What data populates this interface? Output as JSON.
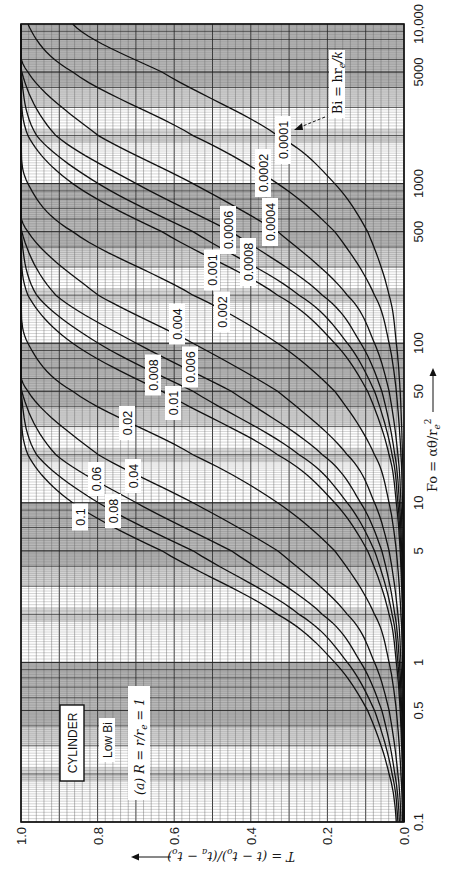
{
  "chart_data": {
    "type": "line",
    "orientation": "rotated 90° clockwise (Fo axis vertical on right, T axis horizontal on bottom)",
    "xlabel": "Fo = αθ/r_e²",
    "ylabel": "T = (t − t_o)/(t_a − t_o)",
    "xscale": "log",
    "xlim": [
      0.1,
      10000
    ],
    "ylim": [
      0.0,
      1.0
    ],
    "x_ticks": [
      0.1,
      0.5,
      1,
      5,
      10,
      50,
      100,
      500,
      1000,
      5000,
      10000
    ],
    "x_tick_labels": [
      "0.1",
      "0.5",
      "1",
      "5",
      "10",
      "50",
      "100",
      "500",
      "1000",
      "5000",
      "10,000"
    ],
    "y_ticks": [
      0.0,
      0.2,
      0.4,
      0.6,
      0.8,
      1.0
    ],
    "y_tick_labels": [
      "0.0",
      "0.2",
      "0.4",
      "0.6",
      "0.8",
      "1.0"
    ],
    "grid": true,
    "legend_title": "Bi = hr_e/k",
    "x": [
      0.1,
      0.2,
      0.5,
      1,
      2,
      5,
      10,
      20,
      50,
      100,
      200,
      500,
      1000,
      2000,
      5000,
      10000
    ],
    "series": [
      {
        "name": "0.1",
        "values": [
          0.02,
          0.039,
          0.095,
          0.181,
          0.33,
          0.632,
          0.865,
          0.982,
          1.0,
          1.0,
          1.0,
          1.0,
          1.0,
          1.0,
          1.0,
          1.0
        ]
      },
      {
        "name": "0.08",
        "values": [
          0.016,
          0.031,
          0.077,
          0.148,
          0.274,
          0.551,
          0.798,
          0.959,
          1.0,
          1.0,
          1.0,
          1.0,
          1.0,
          1.0,
          1.0,
          1.0
        ]
      },
      {
        "name": "0.06",
        "values": [
          0.012,
          0.024,
          0.058,
          0.113,
          0.213,
          0.451,
          0.699,
          0.909,
          0.998,
          1.0,
          1.0,
          1.0,
          1.0,
          1.0,
          1.0,
          1.0
        ]
      },
      {
        "name": "0.04",
        "values": [
          0.008,
          0.016,
          0.039,
          0.077,
          0.148,
          0.33,
          0.551,
          0.798,
          0.982,
          1.0,
          1.0,
          1.0,
          1.0,
          1.0,
          1.0,
          1.0
        ]
      },
      {
        "name": "0.02",
        "values": [
          0.004,
          0.008,
          0.02,
          0.039,
          0.077,
          0.181,
          0.33,
          0.551,
          0.865,
          0.982,
          1.0,
          1.0,
          1.0,
          1.0,
          1.0,
          1.0
        ]
      },
      {
        "name": "0.01",
        "values": [
          0.002,
          0.004,
          0.01,
          0.02,
          0.039,
          0.095,
          0.181,
          0.33,
          0.632,
          0.865,
          0.982,
          1.0,
          1.0,
          1.0,
          1.0,
          1.0
        ]
      },
      {
        "name": "0.008",
        "values": [
          0.002,
          0.003,
          0.008,
          0.016,
          0.031,
          0.077,
          0.148,
          0.274,
          0.551,
          0.798,
          0.959,
          1.0,
          1.0,
          1.0,
          1.0,
          1.0
        ]
      },
      {
        "name": "0.006",
        "values": [
          0.001,
          0.002,
          0.006,
          0.012,
          0.024,
          0.058,
          0.113,
          0.213,
          0.451,
          0.699,
          0.909,
          0.998,
          1.0,
          1.0,
          1.0,
          1.0
        ]
      },
      {
        "name": "0.004",
        "values": [
          0.001,
          0.002,
          0.004,
          0.008,
          0.016,
          0.039,
          0.077,
          0.148,
          0.33,
          0.551,
          0.798,
          0.982,
          1.0,
          1.0,
          1.0,
          1.0
        ]
      },
      {
        "name": "0.002",
        "values": [
          0.0,
          0.001,
          0.002,
          0.004,
          0.008,
          0.02,
          0.039,
          0.077,
          0.181,
          0.33,
          0.551,
          0.865,
          0.982,
          1.0,
          1.0,
          1.0
        ]
      },
      {
        "name": "0.001",
        "values": [
          0.0,
          0.0,
          0.001,
          0.002,
          0.004,
          0.01,
          0.02,
          0.039,
          0.095,
          0.181,
          0.33,
          0.632,
          0.865,
          0.982,
          1.0,
          1.0
        ]
      },
      {
        "name": "0.0008",
        "values": [
          0.0,
          0.0,
          0.001,
          0.002,
          0.003,
          0.008,
          0.016,
          0.031,
          0.077,
          0.148,
          0.274,
          0.551,
          0.798,
          0.959,
          1.0,
          1.0
        ]
      },
      {
        "name": "0.0006",
        "values": [
          0.0,
          0.0,
          0.001,
          0.001,
          0.002,
          0.006,
          0.012,
          0.024,
          0.058,
          0.113,
          0.213,
          0.451,
          0.699,
          0.909,
          0.998,
          1.0
        ]
      },
      {
        "name": "0.0004",
        "values": [
          0.0,
          0.0,
          0.0,
          0.001,
          0.002,
          0.004,
          0.008,
          0.016,
          0.039,
          0.077,
          0.148,
          0.33,
          0.551,
          0.798,
          0.982,
          1.0
        ]
      },
      {
        "name": "0.0002",
        "values": [
          0.0,
          0.0,
          0.0,
          0.0,
          0.001,
          0.002,
          0.004,
          0.008,
          0.02,
          0.039,
          0.077,
          0.181,
          0.33,
          0.551,
          0.865,
          0.982
        ]
      },
      {
        "name": "0.0001",
        "values": [
          0.0,
          0.0,
          0.0,
          0.0,
          0.0,
          0.001,
          0.002,
          0.004,
          0.01,
          0.02,
          0.039,
          0.095,
          0.181,
          0.33,
          0.632,
          0.865
        ]
      }
    ],
    "annotations": [
      "CYLINDER",
      "Low Bi",
      "(a) R = r/r_e = 1",
      "Bi = hr_e/k"
    ]
  },
  "labels": {
    "cylinder": "CYLINDER",
    "low_bi": "Low Bi",
    "case": "(a)  R = r/r",
    "case_sub": "e",
    "case_end": " = 1",
    "bi_main": "Bi = hr",
    "bi_sub": "e",
    "bi_end": "/k",
    "fo_title_main": "Fo = αθ/r",
    "fo_title_sub": "e",
    "fo_title_sup": "2",
    "t_title": "T = (t − t",
    "t_title_sub1": "o",
    "t_title_mid": ")/(t",
    "t_title_sub2": "a",
    "t_title_mid2": " − t",
    "t_title_sub3": "o",
    "t_title_end": ")"
  },
  "curve_label_positions": [
    {
      "name": "0.1",
      "x": 80,
      "y": 517
    },
    {
      "name": "0.08",
      "x": 113,
      "y": 511
    },
    {
      "name": "0.06",
      "x": 96,
      "y": 479
    },
    {
      "name": "0.04",
      "x": 133,
      "y": 476
    },
    {
      "name": "0.02",
      "x": 127,
      "y": 423
    },
    {
      "name": "0.01",
      "x": 173,
      "y": 403
    },
    {
      "name": "0.008",
      "x": 153,
      "y": 375
    },
    {
      "name": "0.006",
      "x": 190,
      "y": 367
    },
    {
      "name": "0.004",
      "x": 177,
      "y": 324
    },
    {
      "name": "0.002",
      "x": 222,
      "y": 312
    },
    {
      "name": "0.001",
      "x": 212,
      "y": 270
    },
    {
      "name": "0.0008",
      "x": 248,
      "y": 262
    },
    {
      "name": "0.0006",
      "x": 228,
      "y": 230
    },
    {
      "name": "0.0004",
      "x": 270,
      "y": 222
    },
    {
      "name": "0.0002",
      "x": 263,
      "y": 173
    },
    {
      "name": "0.0001",
      "x": 283,
      "y": 140
    }
  ],
  "colors": {
    "background": "#ffffff",
    "band": "#b8b8b8",
    "band_light": "#d6d6d6",
    "grid_minor": "#6a6a6a",
    "grid_major": "#2a2a2a",
    "curve": "#111111",
    "frame": "#111111"
  }
}
